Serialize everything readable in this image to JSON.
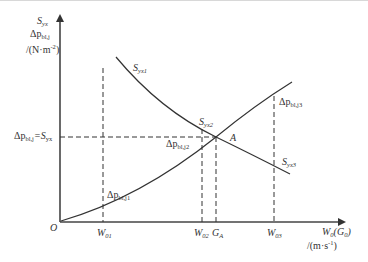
{
  "diagram": {
    "type": "supply-demand-intersection",
    "y_axis": {
      "line1": "S",
      "line1_sub": "yx",
      "line2": "Δp",
      "line2_sub": "bl,j",
      "unit": "/(N·m",
      "unit_sup": "-2",
      "unit_close": ")"
    },
    "x_axis": {
      "label": "W",
      "label_sub": "0",
      "label_paren_open": "(G",
      "label_paren_sub": "0",
      "label_paren_close": ")",
      "unit": "/(m·s",
      "unit_sup": "-1",
      "unit_close": ")"
    },
    "origin": "O",
    "equal_label": {
      "left": "Δp",
      "left_sub": "bl,j",
      "eq": "=S",
      "right_sub": "yx"
    },
    "x_ticks": [
      {
        "main": "W",
        "sub": "01"
      },
      {
        "main": "W",
        "sub": "02"
      },
      {
        "main": "G",
        "sub": "A"
      },
      {
        "main": "W",
        "sub": "03"
      }
    ],
    "intersection": "A",
    "curves": {
      "falling": {
        "name": "S_yx",
        "points": [
          {
            "main": "S",
            "sub": "yx1"
          },
          {
            "main": "S",
            "sub": "yx2"
          },
          {
            "main": "S",
            "sub": "yx3"
          }
        ]
      },
      "rising": {
        "name": "Δp_bl,j",
        "points": [
          {
            "main": "Δp",
            "sub": "bl,j1"
          },
          {
            "main": "Δp",
            "sub": "bl,j2"
          },
          {
            "main": "Δp",
            "sub": "bl,j3"
          }
        ]
      }
    },
    "colors": {
      "axis": "#444444",
      "curve": "#333333",
      "dashed": "#333333",
      "text": "#333333"
    }
  }
}
